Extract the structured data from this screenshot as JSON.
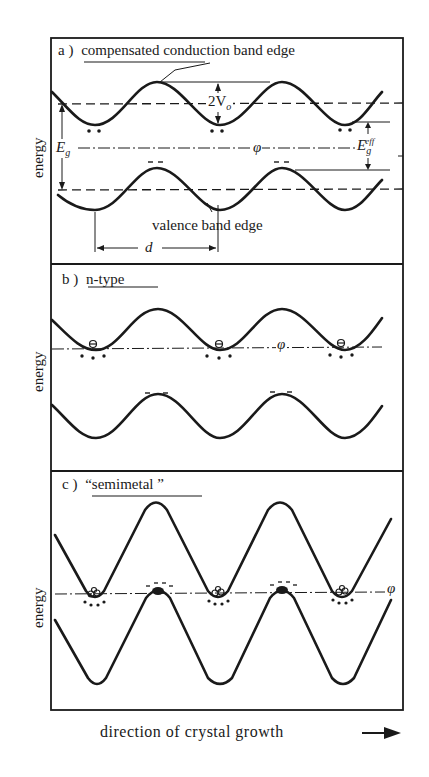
{
  "figure": {
    "panels": [
      {
        "id": "a",
        "label": "a )",
        "title": "compensated conduction band edge",
        "y_label": "energy",
        "annotations": {
          "two_v0": "2V",
          "two_v0_sub": "o",
          "e_g": "E",
          "e_g_sub": "g",
          "e_g_eff": "E",
          "e_g_eff_sub": "g",
          "e_g_eff_sup": "eff",
          "phi": "φ",
          "valence_label": "valence  band edge",
          "d_label": "d"
        }
      },
      {
        "id": "b",
        "label": "b )",
        "title": "n-type",
        "y_label": "energy",
        "annotations": {
          "phi": "φ"
        }
      },
      {
        "id": "c",
        "label": "c )",
        "title": "“semimetal ”",
        "y_label": "energy",
        "annotations": {
          "phi": "φ"
        }
      }
    ],
    "x_caption": "direction of crystal growth",
    "x_arrow": "→",
    "colors": {
      "ink": "#1a1a1a",
      "paper": "#ffffff"
    }
  }
}
